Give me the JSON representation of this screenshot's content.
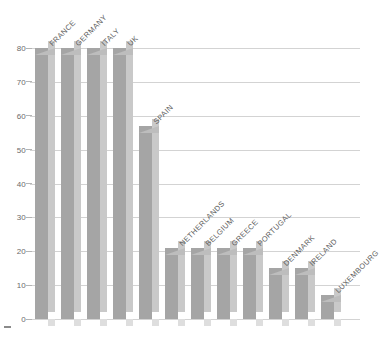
{
  "chart_data": {
    "type": "bar",
    "title": "",
    "subtitle": "",
    "xlabel": "",
    "ylabel": "",
    "categories": [
      "FRANCE",
      "GERMANY",
      "ITALY",
      "UK",
      "SPAIN",
      "NETHERLANDS",
      "BELGIUM",
      "GREECE",
      "PORTUGAL",
      "DENMARK",
      "IRELAND",
      "LUXEMBOURG"
    ],
    "values": [
      80,
      80,
      80,
      80,
      57,
      21,
      21,
      21,
      21,
      15,
      15,
      7
    ],
    "ylim": [
      0,
      80
    ],
    "yticks": [
      0,
      10,
      20,
      30,
      40,
      50,
      60,
      70,
      80
    ],
    "ytick_labels": [
      "0",
      "10",
      "20",
      "30",
      "40",
      "50",
      "60",
      "70",
      "80"
    ],
    "grid": true,
    "legend": "none",
    "style": "3d-bar",
    "colors": {
      "bar_front": "#a5a5a5",
      "bar_side": "#c9c9c9",
      "bar_top": "#bdbdbd",
      "gridline": "#d3d3d3",
      "tick_label": "#6b6b6b",
      "category_label": "#5d5d5d",
      "background": "#ffffff"
    }
  }
}
